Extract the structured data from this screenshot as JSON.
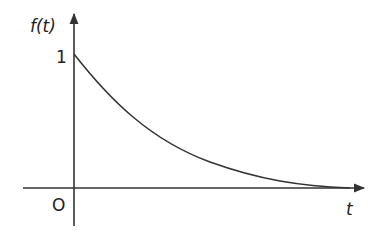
{
  "figure": {
    "y_label": "f(t)",
    "x_label": "t",
    "origin_label": "O",
    "y_tick_label": "1",
    "curve_description": "exponential decay from 1 toward 0",
    "stroke_color": "#333333",
    "background": "#ffffff"
  }
}
